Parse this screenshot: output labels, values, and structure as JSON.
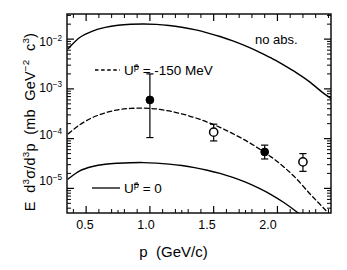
{
  "chart_data": {
    "type": "line",
    "title": "",
    "xlabel": "p  (GeV/c)",
    "ylabel": "E d3σ/d3p  (mb GeV-2 c3)",
    "xlabel_parts": {
      "symbol": "p",
      "units": "(GeV/c)"
    },
    "ylabel_parts": {
      "e": "E",
      "d3sigma": "d",
      "sigma": "σ",
      "over": "/d",
      "p": "p",
      "units": "(mb  GeV",
      "units_exp": "-2",
      "units_tail": " c",
      "units_tail_exp": "3",
      "units_close": ")"
    },
    "xscale": "linear",
    "yscale": "log",
    "xlim": [
      0.35,
      2.42
    ],
    "ylim": [
      3.2e-06,
      0.032
    ],
    "xticks": [
      0.5,
      1.0,
      1.5,
      2.0
    ],
    "xticklabels": [
      "0.5",
      "1.0",
      "1.5",
      "2.0"
    ],
    "yticks": [
      0.01,
      0.001,
      0.0001,
      1e-05
    ],
    "yticklabels": [
      "10-2",
      "10-3",
      "10-4",
      "10-5"
    ],
    "yticklabel_exps": [
      "-2",
      "-3",
      "-4",
      "-5"
    ],
    "yticklabel_base": "10",
    "minor_ticks": true,
    "grid": false,
    "annotations": [
      {
        "text": "no abs.",
        "x": 2.02,
        "y": 0.0135
      }
    ],
    "legend": {
      "position": "inside",
      "entries": [
        {
          "label": "Uᵖ = -150 MeV",
          "style": "dashed",
          "label_u": "U",
          "label_sup": "p̄",
          "label_rest": "=  -150  MeV"
        },
        {
          "label": "Uᵖ = 0",
          "style": "solid",
          "label_u": "U",
          "label_sup": "p̄",
          "label_rest": "=  0"
        }
      ]
    },
    "series": [
      {
        "name": "U p-bar = 0 (no abs., upper)",
        "style": "solid",
        "comment": "upper solid curve",
        "x": [
          0.36,
          0.45,
          0.55,
          0.65,
          0.75,
          0.85,
          0.95,
          1.05,
          1.15,
          1.25,
          1.35,
          1.45,
          1.55,
          1.65,
          1.75,
          1.85,
          1.95,
          2.05,
          2.15,
          2.25,
          2.35,
          2.42
        ],
        "y": [
          0.0065,
          0.0108,
          0.0145,
          0.0172,
          0.019,
          0.0199,
          0.0202,
          0.0198,
          0.0188,
          0.0173,
          0.0155,
          0.0134,
          0.0113,
          0.0092,
          0.0073,
          0.0056,
          0.0042,
          0.003,
          0.0021,
          0.0014,
          0.00086,
          0.00064
        ]
      },
      {
        "name": "U p-bar = -150 MeV",
        "style": "dashed",
        "comment": "middle dashed curve",
        "x": [
          0.36,
          0.45,
          0.55,
          0.65,
          0.75,
          0.85,
          0.95,
          1.05,
          1.15,
          1.25,
          1.35,
          1.45,
          1.55,
          1.65,
          1.75,
          1.85,
          1.95,
          2.05,
          2.15,
          2.25,
          2.32,
          2.38
        ],
        "y": [
          0.000125,
          0.00019,
          0.000265,
          0.00033,
          0.00038,
          0.000405,
          0.00041,
          0.000395,
          0.00036,
          0.000315,
          0.000265,
          0.000215,
          0.000168,
          0.000126,
          9.2e-05,
          6.4e-05,
          4.3e-05,
          2.7e-05,
          1.55e-05,
          8e-06,
          5.2e-06,
          3.6e-06
        ]
      },
      {
        "name": "U p-bar = 0 (lower)",
        "style": "solid",
        "comment": "lower solid curve",
        "x": [
          0.36,
          0.45,
          0.55,
          0.65,
          0.75,
          0.85,
          0.95,
          1.05,
          1.15,
          1.25,
          1.35,
          1.45,
          1.55,
          1.65,
          1.75,
          1.85,
          1.95,
          2.05,
          2.15,
          2.25,
          2.35,
          2.42
        ],
        "y": [
          1.55e-05,
          2.25e-05,
          2.75e-05,
          3.05e-05,
          3.2e-05,
          3.28e-05,
          3.3e-05,
          3.22e-05,
          3.08e-05,
          2.88e-05,
          2.62e-05,
          2.32e-05,
          2e-05,
          1.66e-05,
          1.33e-05,
          1.02e-05,
          7.5e-06,
          5.2e-06,
          3.4e-06,
          2.1e-06,
          1.2e-06,
          8e-07
        ]
      }
    ],
    "data_points": [
      {
        "marker": "filled-circle",
        "x": 1.0,
        "y": 0.0006,
        "yerr_low": 0.000105,
        "yerr_high": 0.002
      },
      {
        "marker": "open-circle",
        "x": 1.5,
        "y": 0.000135,
        "yerr_low": 9e-05,
        "yerr_high": 0.000195
      },
      {
        "marker": "filled-circle",
        "x": 1.9,
        "y": 5.4e-05,
        "yerr_low": 3.9e-05,
        "yerr_high": 7.4e-05
      },
      {
        "marker": "open-circle",
        "x": 2.2,
        "y": 3.4e-05,
        "yerr_low": 2.2e-05,
        "yerr_high": 5e-05
      }
    ]
  },
  "frame": {
    "left_px": 67,
    "right_px": 331,
    "top_px": 14,
    "bottom_px": 213
  }
}
